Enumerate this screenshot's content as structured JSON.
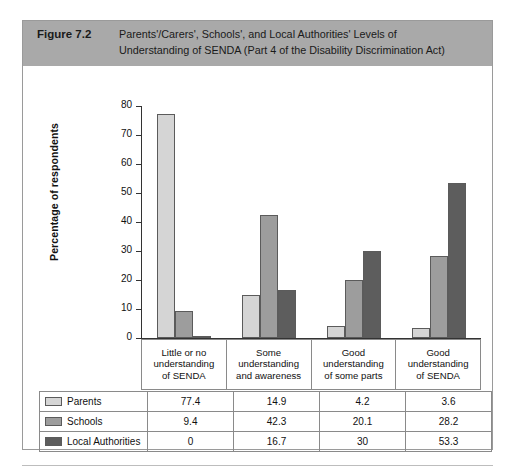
{
  "figure": {
    "number_label": "Figure 7.2",
    "caption_line1": "Parents'/Carers', Schools', and Local Authorities' Levels of",
    "caption_line2": "Understanding of SENDA (Part 4 of the Disability Discrimination Act)",
    "header_bg": "#a9a9a9"
  },
  "chart_data": {
    "type": "bar",
    "title": "Parents'/Carers', Schools', and Local Authorities' Levels of Understanding of SENDA (Part 4 of the Disability Discrimination Act)",
    "xlabel": "",
    "ylabel": "Percentage of respondents",
    "ylim": [
      0,
      80
    ],
    "ytick_step": 10,
    "yticks": [
      0,
      10,
      20,
      30,
      40,
      50,
      60,
      70,
      80
    ],
    "ytick_labels": [
      "0",
      "10",
      "20",
      "30",
      "40",
      "50",
      "60",
      "70",
      "80"
    ],
    "grid": false,
    "legend_position": "table-below",
    "categories": [
      "Little or no understanding of SENDA",
      "Some understanding and awareness",
      "Good understanding of some parts",
      "Good understanding of SENDA"
    ],
    "category_lines": [
      [
        "Little or no",
        "understanding",
        "of SENDA"
      ],
      [
        "Some",
        "understanding",
        "and awareness"
      ],
      [
        "Good",
        "understanding",
        "of some parts"
      ],
      [
        "Good",
        "understanding",
        "of SENDA"
      ]
    ],
    "series": [
      {
        "name": "Parents",
        "color": "#d5d5d5",
        "values": [
          77.4,
          14.9,
          4.2,
          3.6
        ],
        "value_labels": [
          "77.4",
          "14.9",
          "4.2",
          "3.6"
        ]
      },
      {
        "name": "Schools",
        "color": "#9d9d9d",
        "values": [
          9.4,
          42.3,
          20.1,
          28.2
        ],
        "value_labels": [
          "9.4",
          "42.3",
          "20.1",
          "28.2"
        ]
      },
      {
        "name": "Local Authorities",
        "color": "#5d5d5d",
        "values": [
          0,
          16.7,
          30,
          53.3
        ],
        "value_labels": [
          "0",
          "16.7",
          "30",
          "53.3"
        ]
      }
    ]
  }
}
